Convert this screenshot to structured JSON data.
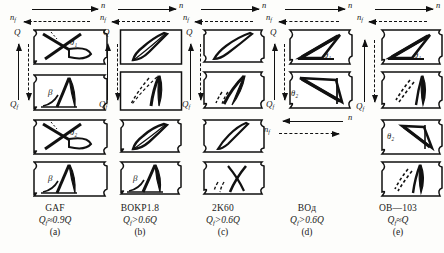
{
  "figure": {
    "background_color": "#fdfdfb",
    "ink_color": "#111111",
    "arrow_labels": {
      "n": "n",
      "n_sub": "f",
      "q": "Q",
      "q_sub": "f"
    },
    "angle_labels": {
      "theta": "θ",
      "theta1_sub": "1",
      "theta2_sub": "2",
      "beta": "β"
    }
  },
  "columns": [
    {
      "id": "a",
      "name": "GAF",
      "flow": "Q",
      "flow_sub": "f",
      "flow_relation": "≈0.9",
      "flow_tail": "Q",
      "index": "(a)",
      "panel_count": 4,
      "top_arrows": {
        "solid_dir": "right",
        "solid_label": "n",
        "dashed_dir": "left",
        "dashed_label": "n"
      },
      "bottom_arrows": null,
      "panels": [
        {
          "label": "θ",
          "label_sub": "1",
          "kind": "crossed-blade"
        },
        {
          "label": "β",
          "label_sub": "",
          "kind": "curved-vane"
        },
        {
          "label": "θ",
          "label_sub": "2",
          "kind": "crossed-blade"
        },
        {
          "label": "β",
          "label_sub": "",
          "kind": "curved-vane"
        }
      ]
    },
    {
      "id": "b",
      "name": "BOKP1.8",
      "flow": "Q",
      "flow_sub": "f",
      "flow_relation": ">0.6",
      "flow_tail": "Q",
      "index": "(b)",
      "panel_count": 4,
      "top_arrows": {
        "solid_dir": "right",
        "solid_label": "n",
        "dashed_dir": "left",
        "dashed_label": "n"
      },
      "bottom_arrows": null,
      "panels": [
        {
          "label": "",
          "label_sub": "",
          "kind": "slim-blade"
        },
        {
          "label": "",
          "label_sub": "",
          "kind": "ghost-vane"
        },
        {
          "label": "",
          "label_sub": "",
          "kind": "slim-blade"
        },
        {
          "label": "β",
          "label_sub": "",
          "kind": "curved-vane"
        }
      ]
    },
    {
      "id": "c",
      "name": "2K60",
      "flow": "Q",
      "flow_sub": "f",
      "flow_relation": ">0.6",
      "flow_tail": "Q",
      "index": "(c)",
      "panel_count": 4,
      "top_arrows": {
        "solid_dir": "right",
        "solid_label": "n",
        "dashed_dir": "left",
        "dashed_label": "n"
      },
      "bottom_arrows": null,
      "panels": [
        {
          "label": "",
          "label_sub": "",
          "kind": "leaf-blade"
        },
        {
          "label": "",
          "label_sub": "",
          "kind": "ghost-leaf"
        },
        {
          "label": "",
          "label_sub": "",
          "kind": "leaf-blade"
        },
        {
          "label": "",
          "label_sub": "",
          "kind": "ghost-cross"
        }
      ]
    },
    {
      "id": "d",
      "name": "ВОд",
      "flow": "Q",
      "flow_sub": "f",
      "flow_relation": ">0.6",
      "flow_tail": "Q",
      "index": "(d)",
      "panel_count": 2,
      "top_arrows": {
        "solid_dir": "right",
        "solid_label": "n",
        "dashed_dir": "left",
        "dashed_label": "n"
      },
      "bottom_arrows": {
        "solid_dir": "left",
        "solid_label": "n",
        "dashed_dir": "right",
        "dashed_label": "n"
      },
      "panels": [
        {
          "label": "θ",
          "label_sub": "1",
          "kind": "wedge-blade"
        },
        {
          "label": "θ",
          "label_sub": "2",
          "kind": "wedge-blade-flip"
        }
      ]
    },
    {
      "id": "e",
      "name": "ОВ—103",
      "flow": "Q",
      "flow_sub": "f",
      "flow_relation": "≈",
      "flow_tail": "Q",
      "index": "(e)",
      "panel_count": 4,
      "top_arrows": {
        "solid_dir": "right",
        "solid_label": "n",
        "dashed_dir": "left",
        "dashed_label": "n"
      },
      "bottom_arrows": null,
      "panels": [
        {
          "label": "θ",
          "label_sub": "1",
          "kind": "wedge-blade"
        },
        {
          "label": "",
          "label_sub": "",
          "kind": "dashed-vane"
        },
        {
          "label": "θ",
          "label_sub": "2",
          "kind": "wedge-blade-flip"
        },
        {
          "label": "",
          "label_sub": "",
          "kind": "dashed-vane"
        }
      ]
    }
  ]
}
